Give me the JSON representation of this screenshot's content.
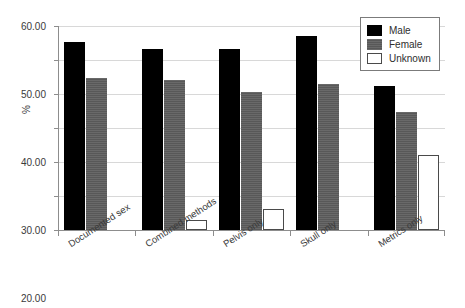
{
  "chart_data": {
    "type": "bar",
    "title": "",
    "xlabel": "",
    "ylabel": "%",
    "ylim": [
      0,
      60
    ],
    "ytick_labels": [
      "0.00",
      "10.00",
      "20.00",
      "30.00",
      "40.00",
      "50.00",
      "60.00"
    ],
    "ytick_values": [
      0,
      10,
      20,
      30,
      40,
      50,
      60
    ],
    "grid": true,
    "legend_position": "top-right",
    "categories": [
      "Documented sex",
      "Combined methods",
      "Pelvis only",
      "Skull only",
      "Metrics only"
    ],
    "series": [
      {
        "name": "Male",
        "color": "#000000",
        "values": [
          55.3,
          53.2,
          53.2,
          57.2,
          42.5
        ]
      },
      {
        "name": "Female",
        "color": "#585858",
        "values": [
          44.7,
          44.1,
          40.7,
          42.8,
          34.7
        ]
      },
      {
        "name": "Unknown",
        "color": "#ffffff",
        "values": [
          0,
          2.8,
          6.1,
          0,
          22.0
        ]
      }
    ]
  },
  "legend": {
    "items": [
      {
        "label": "Male",
        "swatch": "male"
      },
      {
        "label": "Female",
        "swatch": "female"
      },
      {
        "label": "Unknown",
        "swatch": "unknown"
      }
    ]
  },
  "axis": {
    "y_title": "%"
  }
}
